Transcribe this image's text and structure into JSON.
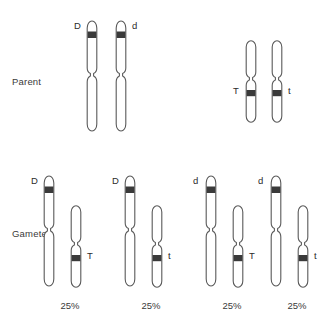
{
  "diagram": {
    "background": "#ffffff",
    "outline_color": "#5a5a5a",
    "band_color": "#3a3a3a",
    "fill_color": "#ffffff",
    "rows": [
      {
        "key": "parent",
        "label": "Parent"
      },
      {
        "key": "gametes",
        "label": "Gametes"
      }
    ],
    "parent": {
      "label": "Parent",
      "pairs": [
        {
          "name": "long-pair",
          "chromosomes": [
            {
              "allele": "D",
              "allele_side": "left",
              "type": "long",
              "band": "upper"
            },
            {
              "allele": "d",
              "allele_side": "right",
              "type": "long",
              "band": "upper"
            }
          ]
        },
        {
          "name": "short-pair",
          "chromosomes": [
            {
              "allele": "T",
              "allele_side": "left",
              "type": "short",
              "band": "lower"
            },
            {
              "allele": "t",
              "allele_side": "right",
              "type": "short",
              "band": "lower"
            }
          ]
        }
      ]
    },
    "gametes": {
      "label": "Gametes",
      "items": [
        {
          "name": "gamete-1",
          "percent": "25%",
          "long": {
            "allele": "D",
            "allele_side": "left",
            "type": "long",
            "band": "upper"
          },
          "short": {
            "allele": "T",
            "allele_side": "right",
            "type": "short",
            "band": "lower"
          }
        },
        {
          "name": "gamete-2",
          "percent": "25%",
          "long": {
            "allele": "D",
            "allele_side": "left",
            "type": "long",
            "band": "upper"
          },
          "short": {
            "allele": "t",
            "allele_side": "right",
            "type": "short",
            "band": "lower"
          }
        },
        {
          "name": "gamete-3",
          "percent": "25%",
          "long": {
            "allele": "d",
            "allele_side": "left",
            "type": "long",
            "band": "upper"
          },
          "short": {
            "allele": "T",
            "allele_side": "right",
            "type": "short",
            "band": "lower"
          }
        },
        {
          "name": "gamete-4",
          "percent": "25%",
          "long": {
            "allele": "d",
            "allele_side": "left",
            "type": "long",
            "band": "upper"
          },
          "short": {
            "allele": "t",
            "allele_side": "right",
            "type": "short",
            "band": "lower"
          }
        }
      ]
    }
  }
}
